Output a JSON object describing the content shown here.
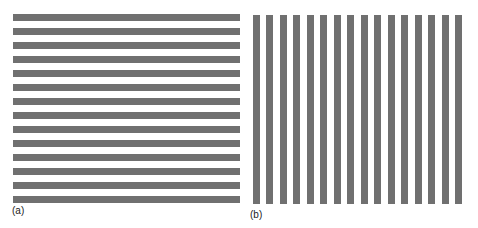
{
  "figure": {
    "stripe_color": "#707070",
    "background": "#ffffff",
    "panels": [
      {
        "id": "a",
        "label": "(a)",
        "orientation": "horizontal",
        "stripe_count": 14,
        "x": 13,
        "y": 14,
        "width": 227,
        "height": 189,
        "period": 14,
        "stripe_thickness": 7,
        "label_x": 12,
        "label_y": 206
      },
      {
        "id": "b",
        "label": "(b)",
        "orientation": "vertical",
        "stripe_count": 16,
        "x": 253,
        "y": 15,
        "width": 209,
        "height": 189,
        "period": 13.47,
        "stripe_thickness": 7,
        "label_x": 250,
        "label_y": 210
      }
    ]
  }
}
